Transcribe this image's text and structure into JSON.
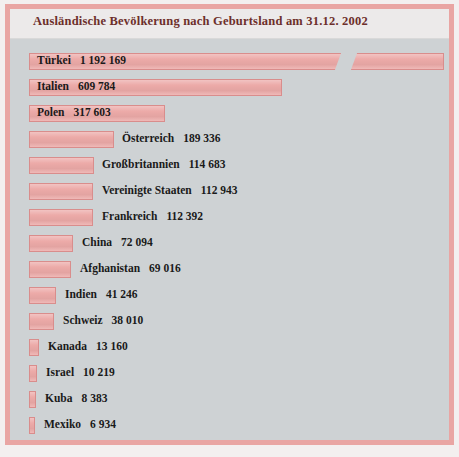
{
  "chart_data": {
    "type": "bar",
    "title": "Ausländische Bevölkerung nach Geburtsland am 31.12. 2002",
    "xlabel": "",
    "ylabel": "",
    "orientation": "horizontal",
    "grid": false,
    "legend": null,
    "axis_break": true,
    "axis_break_note": "Balken für Türkei ist unterbrochen (Maßstabsbruch)",
    "categories": [
      "Türkei",
      "Italien",
      "Polen",
      "Österreich",
      "Großbritannien",
      "Vereinigte Staaten",
      "Frankreich",
      "China",
      "Afghanistan",
      "Indien",
      "Schweiz",
      "Kanada",
      "Israel",
      "Kuba",
      "Mexiko"
    ],
    "values": [
      1192169,
      609784,
      317603,
      189336,
      114683,
      112943,
      112392,
      72094,
      69016,
      41246,
      38010,
      13160,
      10219,
      8383,
      6934
    ],
    "value_labels": [
      "1 192 169",
      "609 784",
      "317 603",
      "189 336",
      "114 683",
      "112 943",
      "112 392",
      "72 094",
      "69 016",
      "41 246",
      "38 010",
      "13 160",
      "10 219",
      "8 383",
      "6 934"
    ],
    "xlim": [
      0,
      660000
    ]
  },
  "colors": {
    "bar_fill": "#ecaaa8",
    "bar_border": "#d98d8c",
    "frame_border": "#e9a5a3",
    "plot_background": "#ced2d4",
    "title_band": "#eceaea",
    "title_text": "#6d2f2b",
    "label_text": "#1a1a1a"
  },
  "rows": [
    {
      "name": "Türkei",
      "value_label": "1 192 169",
      "bar_left": 19,
      "bar_width": 415,
      "label_inside": true,
      "label_left": 27,
      "broken": true,
      "break_left": 328
    },
    {
      "name": "Italien",
      "value_label": "609 784",
      "bar_left": 19,
      "bar_width": 253,
      "label_inside": true,
      "label_left": 27,
      "broken": false
    },
    {
      "name": "Polen",
      "value_label": "317 603",
      "bar_left": 19,
      "bar_width": 136,
      "label_inside": true,
      "label_left": 27,
      "broken": false
    },
    {
      "name": "Österreich",
      "value_label": "189 336",
      "bar_left": 19,
      "bar_width": 85,
      "label_inside": false,
      "label_left": 112,
      "broken": false
    },
    {
      "name": "Großbritannien",
      "value_label": "114 683",
      "bar_left": 19,
      "bar_width": 65,
      "label_inside": false,
      "label_left": 92,
      "broken": false
    },
    {
      "name": "Vereinigte Staaten",
      "value_label": "112 943",
      "bar_left": 19,
      "bar_width": 64,
      "label_inside": false,
      "label_left": 92,
      "broken": false
    },
    {
      "name": "Frankreich",
      "value_label": "112 392",
      "bar_left": 19,
      "bar_width": 64,
      "label_inside": false,
      "label_left": 92,
      "broken": false
    },
    {
      "name": "China",
      "value_label": "72 094",
      "bar_left": 19,
      "bar_width": 44,
      "label_inside": false,
      "label_left": 72,
      "broken": false
    },
    {
      "name": "Afghanistan",
      "value_label": "69 016",
      "bar_left": 19,
      "bar_width": 42,
      "label_inside": false,
      "label_left": 70,
      "broken": false
    },
    {
      "name": "Indien",
      "value_label": "41 246",
      "bar_left": 19,
      "bar_width": 27,
      "label_inside": false,
      "label_left": 55,
      "broken": false
    },
    {
      "name": "Schweiz",
      "value_label": "38 010",
      "bar_left": 19,
      "bar_width": 25,
      "label_inside": false,
      "label_left": 53,
      "broken": false
    },
    {
      "name": "Kanada",
      "value_label": "13 160",
      "bar_left": 19,
      "bar_width": 10,
      "label_inside": false,
      "label_left": 38,
      "broken": false
    },
    {
      "name": "Israel",
      "value_label": "10 219",
      "bar_left": 19,
      "bar_width": 8,
      "label_inside": false,
      "label_left": 36,
      "broken": false
    },
    {
      "name": "Kuba",
      "value_label": "8 383",
      "bar_left": 19,
      "bar_width": 7,
      "label_inside": false,
      "label_left": 35,
      "broken": false
    },
    {
      "name": "Mexiko",
      "value_label": "6 934",
      "bar_left": 19,
      "bar_width": 6,
      "label_inside": false,
      "label_left": 34,
      "broken": false
    }
  ]
}
